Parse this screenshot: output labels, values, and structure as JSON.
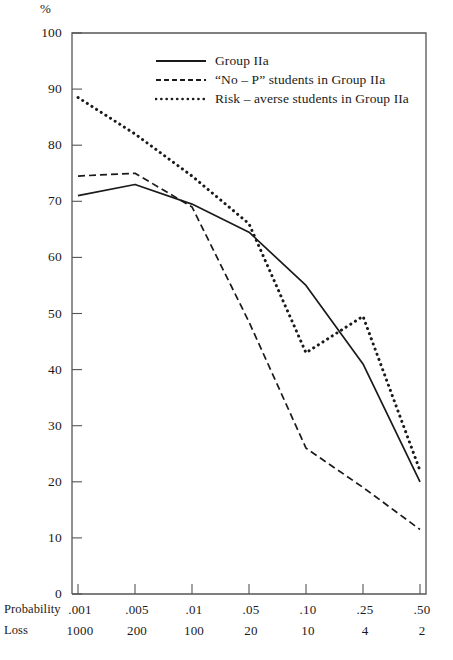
{
  "chart_data": {
    "type": "line",
    "title": "",
    "ylabel": "%",
    "ylim": [
      0,
      100
    ],
    "yticks": [
      0,
      10,
      20,
      30,
      40,
      50,
      60,
      70,
      80,
      90,
      100
    ],
    "ytick_labels": [
      "0",
      "10",
      "20",
      "30",
      "40",
      "50",
      "60",
      "70",
      "80",
      "90",
      "100"
    ],
    "grid": false,
    "legend_position": "top-center",
    "x_axis_rows": [
      {
        "name": "Probability",
        "label": "Probability",
        "values": [
          ".001",
          ".005",
          ".01",
          ".05",
          ".10",
          ".25",
          ".50"
        ]
      },
      {
        "name": "Loss",
        "label": "Loss",
        "values": [
          "1000",
          "200",
          "100",
          "20",
          "10",
          "4",
          "2"
        ]
      }
    ],
    "categories": [
      ".001",
      ".005",
      ".01",
      ".05",
      ".10",
      ".25",
      ".50"
    ],
    "series": [
      {
        "name": "Group IIa",
        "style": "solid",
        "color": "#1a1a1a",
        "values": [
          71,
          73,
          69.5,
          64.5,
          55,
          41,
          20
        ]
      },
      {
        "name": "“No – P” students in Group IIa",
        "style": "dashed",
        "color": "#1a1a1a",
        "values": [
          74.5,
          75,
          69,
          48.5,
          26,
          19,
          11.5
        ]
      },
      {
        "name": "Risk – averse students in Group IIa",
        "style": "dotted",
        "color": "#1a1a1a",
        "values": [
          88.5,
          82,
          74.5,
          66,
          43,
          49.5,
          22
        ]
      }
    ]
  },
  "axes": {
    "frame_color": "#555555",
    "tick_color": "#555555"
  }
}
